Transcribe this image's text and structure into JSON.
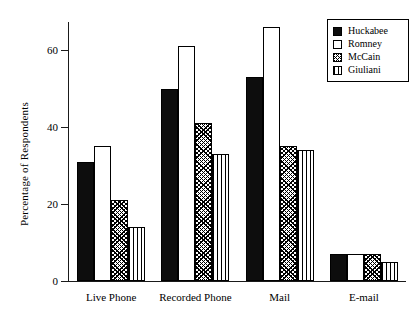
{
  "chart_data": {
    "type": "bar",
    "title": "",
    "xlabel": "",
    "ylabel": "Percentage of Respondents",
    "categories": [
      "Live Phone",
      "Recorded Phone",
      "Mail",
      "E-mail"
    ],
    "series": [
      {
        "name": "Huckabee",
        "fill": "solid",
        "values": [
          31,
          50,
          53,
          7
        ]
      },
      {
        "name": "Romney",
        "fill": "empty",
        "values": [
          35,
          61,
          66,
          7
        ]
      },
      {
        "name": "McCain",
        "fill": "cross",
        "values": [
          21,
          41,
          35,
          7
        ]
      },
      {
        "name": "Giuliani",
        "fill": "vertical",
        "values": [
          14,
          33,
          34,
          5
        ]
      }
    ],
    "ylim": [
      0,
      67.3
    ],
    "yticks": [
      0,
      20,
      40,
      60
    ],
    "ytick_labels": [
      "0",
      "20",
      "40",
      "60"
    ],
    "grid": false,
    "legend_position": "top-right",
    "colors": {
      "axis": "#1a1a1a",
      "bar_outline": "#000000",
      "solid_fill": "#0d0d0d",
      "background": "#ffffff"
    }
  },
  "legend": {
    "entries": [
      {
        "label": "Huckabee"
      },
      {
        "label": "Romney"
      },
      {
        "label": "McCain"
      },
      {
        "label": "Giuliani"
      }
    ]
  }
}
